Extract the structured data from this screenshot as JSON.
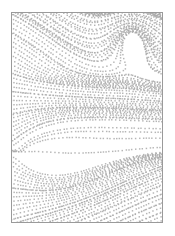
{
  "figure": {
    "title": "Dotted streamline flow field",
    "caption": "",
    "background_color": "#ffffff"
  },
  "frame": {
    "border_color": "#9a9a9a",
    "border_width": 1,
    "fill_color": "#ffffff",
    "x": 11,
    "y": 12,
    "width": 152,
    "height": 211
  },
  "chart_data": {
    "type": "scatter",
    "title": "Dotted streamline flow field",
    "subtitle": "",
    "xlabel": "",
    "ylabel": "",
    "xlim": [
      0,
      150
    ],
    "ylim": [
      0,
      209
    ],
    "grid": false,
    "legend": null,
    "legend_position": "none",
    "tick_labels_x": [],
    "tick_labels_y": [],
    "annotations": [],
    "marker": {
      "shape": "square",
      "size_px": 1.45,
      "color": "#a8a8a8",
      "edge_color": "#a8a8a8",
      "opacity": 0.85
    },
    "sampling": {
      "dot_spacing_px": 2.7,
      "streamline_spacing_px": 4.6,
      "description": "Each streamline is rendered as a dashed trail of small grey square dots."
    },
    "field": {
      "description": "Curved vector field traced as dotted streamlines across a portrait rectangle.",
      "regions": [
        {
          "name": "upper-left-diagonal",
          "x_range": [
            0,
            90
          ],
          "y_range": [
            0,
            60
          ],
          "flow": "diagonal bands descending left-to-right, slope about -0.55"
        },
        {
          "name": "upper-right-hooks",
          "x_range": [
            85,
            150
          ],
          "y_range": [
            0,
            70
          ],
          "flow": "C-shaped hooks curving down from the top edge, bending left then sweeping down-right"
        },
        {
          "name": "central-horizontal-bands",
          "x_range": [
            0,
            150
          ],
          "y_range": [
            60,
            125
          ],
          "flow": "dense nearly horizontal bands with gentle undulation"
        },
        {
          "name": "left-fan-saddle",
          "x_range": [
            0,
            70
          ],
          "y_range": [
            115,
            165
          ],
          "flow": "fan of streamlines diverging from a saddle near the left edge"
        },
        {
          "name": "lower-diagonals",
          "x_range": [
            0,
            150
          ],
          "y_range": [
            150,
            209
          ],
          "flow": "long diagonal bands rising left-to-right, slope about -0.30"
        }
      ],
      "streamline_count": 54
    }
  }
}
